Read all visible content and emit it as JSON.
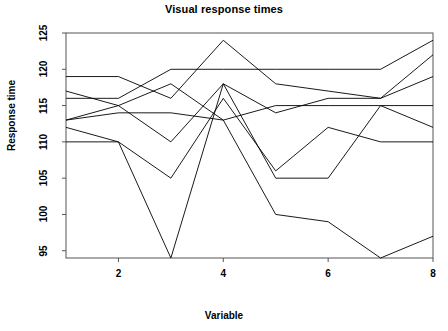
{
  "chart_data": {
    "type": "line",
    "title": "Visual response times",
    "xlabel": "Variable",
    "ylabel": "Response time",
    "x": [
      1,
      2,
      3,
      4,
      5,
      6,
      7,
      8
    ],
    "xlim": [
      1,
      8
    ],
    "ylim": [
      94,
      125
    ],
    "xticks": [
      2,
      4,
      6,
      8
    ],
    "xtick_labels": [
      "2",
      "4",
      "6",
      "8"
    ],
    "yticks": [
      95,
      100,
      105,
      110,
      115,
      120,
      125
    ],
    "ytick_labels": [
      "95",
      "100",
      "105",
      "110",
      "115",
      "120",
      "125"
    ],
    "grid": false,
    "legend": "none",
    "line_color": "#000000",
    "series": [
      {
        "name": "case-1",
        "values": [
          116,
          116,
          120,
          120,
          120,
          120,
          120,
          124
        ]
      },
      {
        "name": "case-2",
        "values": [
          119,
          119,
          116,
          124,
          118,
          117,
          116,
          122
        ]
      },
      {
        "name": "case-3",
        "values": [
          117,
          115,
          110,
          118,
          114,
          116,
          116,
          119
        ]
      },
      {
        "name": "case-4",
        "values": [
          113,
          114,
          114,
          113,
          115,
          115,
          115,
          115
        ]
      },
      {
        "name": "case-5",
        "values": [
          112,
          110,
          105,
          116,
          106,
          112,
          110,
          110
        ]
      },
      {
        "name": "case-6",
        "values": [
          110,
          110,
          94,
          118,
          105,
          105,
          115,
          112
        ]
      },
      {
        "name": "case-7",
        "values": [
          113,
          115,
          118,
          113,
          100,
          99,
          94,
          97
        ]
      }
    ]
  },
  "plot": {
    "left": 66,
    "right": 433,
    "top": 33,
    "bottom": 258
  }
}
